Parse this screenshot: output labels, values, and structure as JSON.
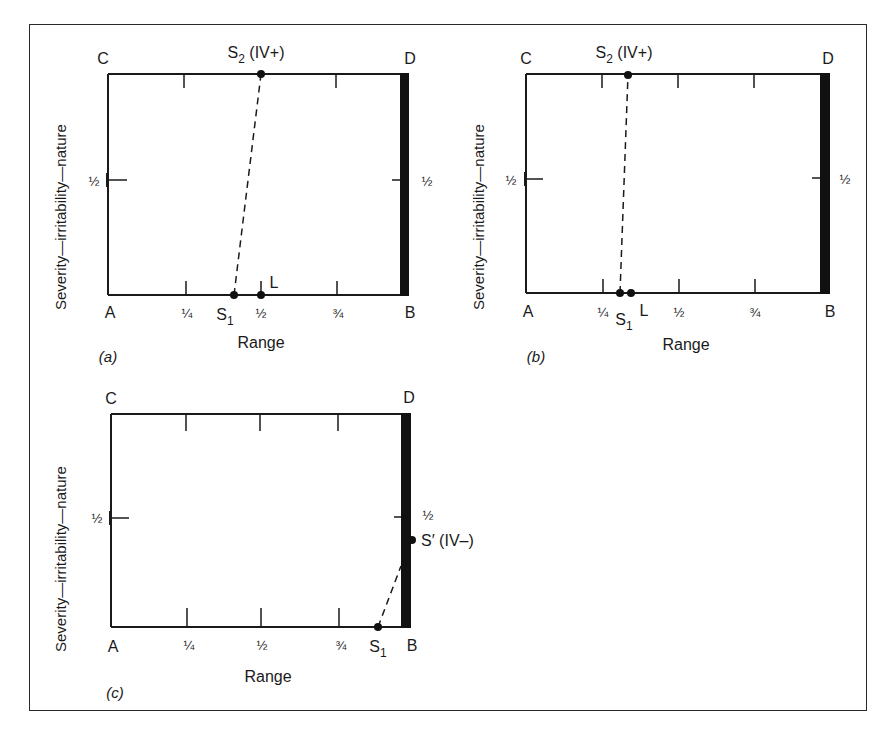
{
  "figure": {
    "ylabel": "Severity—irritability—nature",
    "xlabel": "Range",
    "corner_labels": {
      "A": "A",
      "B": "B",
      "C": "C",
      "D": "D"
    },
    "x_ticks": [
      "¼",
      "½",
      "¾"
    ],
    "half_label": "½",
    "panels": [
      {
        "id": "a",
        "caption": "(a)",
        "points": {
          "S1": {
            "label": "S",
            "sub": "1",
            "range": 0.44,
            "severity": 0
          },
          "L": {
            "label": "L",
            "range": 0.5,
            "severity": 0
          },
          "S2": {
            "label": "S",
            "sub": "2",
            "suffix": " (IV+)",
            "range": 0.5,
            "severity": 1
          }
        }
      },
      {
        "id": "b",
        "caption": "(b)",
        "points": {
          "S1": {
            "label": "S",
            "sub": "1",
            "range": 0.31,
            "severity": 0
          },
          "L": {
            "label": "L",
            "range": 0.33,
            "severity": 0
          },
          "S2": {
            "label": "S",
            "sub": "2",
            "suffix": " (IV+)",
            "range": 0.34,
            "severity": 1
          }
        }
      },
      {
        "id": "c",
        "caption": "(c)",
        "points": {
          "S1": {
            "label": "S",
            "sub": "1",
            "range": 0.91,
            "severity": 0
          },
          "Sprime": {
            "label": "S′ (IV–)",
            "range": 1.0,
            "severity": 0.4
          }
        }
      }
    ]
  }
}
